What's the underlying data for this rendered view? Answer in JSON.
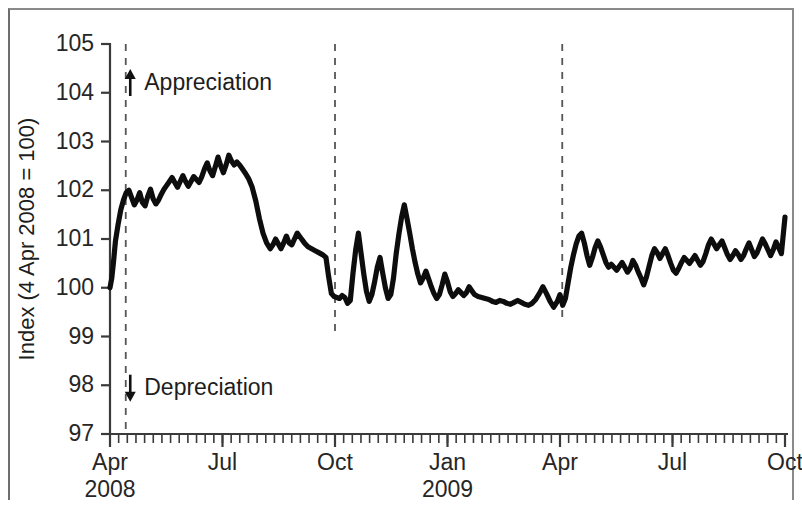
{
  "chart_data": {
    "type": "line",
    "title": "",
    "xlabel": "",
    "ylabel": "Index (4 Apr 2008 = 100)",
    "ylim": [
      97,
      105
    ],
    "xlim": [
      "2008-04-04",
      "2009-10-01"
    ],
    "grid": false,
    "legend_position": "none",
    "y_ticks": [
      97,
      98,
      99,
      100,
      101,
      102,
      103,
      104,
      105
    ],
    "x_ticks": [
      {
        "label": "Apr",
        "year": "2008",
        "pos": 0.0
      },
      {
        "label": "Jul",
        "year": "",
        "pos": 0.25
      },
      {
        "label": "Oct",
        "year": "",
        "pos": 0.5
      },
      {
        "label": "Jan",
        "year": "2009",
        "pos": 0.75
      },
      {
        "label": "Apr",
        "year": "",
        "pos": 1.0
      },
      {
        "label": "Jul",
        "year": "",
        "pos": 1.25
      },
      {
        "label": "Oct",
        "year": "",
        "pos": 1.5
      }
    ],
    "x_minor_tick_count": 78,
    "annotations": [
      {
        "name": "appreciation",
        "text": "Appreciation",
        "arrow": "up",
        "x": 0.045,
        "y": 104.2
      },
      {
        "name": "depreciation",
        "text": "Depreciation",
        "arrow": "down",
        "x": 0.045,
        "y": 97.95
      }
    ],
    "event_lines": [
      {
        "name": "event-line-1",
        "x": 0.035,
        "y_top": 105.0,
        "y_bottom": 97.0,
        "style": "dashed"
      },
      {
        "name": "event-line-2",
        "x": 0.5,
        "y_top": 105.0,
        "y_bottom": 99.05,
        "style": "dashed"
      },
      {
        "name": "event-line-3",
        "x": 1.005,
        "y_top": 105.0,
        "y_bottom": 99.3,
        "style": "dashed"
      }
    ],
    "series": [
      {
        "name": "Exchange rate index",
        "color": "#0d0d0d",
        "points": [
          [
            0.0,
            100.0
          ],
          [
            0.004,
            100.2
          ],
          [
            0.008,
            100.55
          ],
          [
            0.012,
            100.95
          ],
          [
            0.018,
            101.3
          ],
          [
            0.024,
            101.6
          ],
          [
            0.03,
            101.8
          ],
          [
            0.036,
            101.95
          ],
          [
            0.042,
            102.0
          ],
          [
            0.048,
            101.85
          ],
          [
            0.054,
            101.7
          ],
          [
            0.06,
            101.8
          ],
          [
            0.066,
            101.95
          ],
          [
            0.072,
            101.75
          ],
          [
            0.078,
            101.68
          ],
          [
            0.084,
            101.88
          ],
          [
            0.09,
            102.02
          ],
          [
            0.096,
            101.82
          ],
          [
            0.102,
            101.72
          ],
          [
            0.108,
            101.8
          ],
          [
            0.114,
            101.92
          ],
          [
            0.12,
            102.02
          ],
          [
            0.126,
            102.1
          ],
          [
            0.132,
            102.18
          ],
          [
            0.138,
            102.26
          ],
          [
            0.144,
            102.16
          ],
          [
            0.15,
            102.06
          ],
          [
            0.156,
            102.18
          ],
          [
            0.162,
            102.3
          ],
          [
            0.168,
            102.18
          ],
          [
            0.174,
            102.08
          ],
          [
            0.18,
            102.18
          ],
          [
            0.186,
            102.28
          ],
          [
            0.192,
            102.22
          ],
          [
            0.198,
            102.16
          ],
          [
            0.204,
            102.28
          ],
          [
            0.21,
            102.44
          ],
          [
            0.216,
            102.56
          ],
          [
            0.222,
            102.4
          ],
          [
            0.228,
            102.3
          ],
          [
            0.234,
            102.48
          ],
          [
            0.24,
            102.68
          ],
          [
            0.246,
            102.5
          ],
          [
            0.252,
            102.36
          ],
          [
            0.258,
            102.52
          ],
          [
            0.264,
            102.72
          ],
          [
            0.27,
            102.6
          ],
          [
            0.276,
            102.52
          ],
          [
            0.282,
            102.58
          ],
          [
            0.288,
            102.52
          ],
          [
            0.294,
            102.44
          ],
          [
            0.3,
            102.36
          ],
          [
            0.308,
            102.24
          ],
          [
            0.316,
            102.06
          ],
          [
            0.324,
            101.78
          ],
          [
            0.332,
            101.42
          ],
          [
            0.34,
            101.12
          ],
          [
            0.348,
            100.92
          ],
          [
            0.356,
            100.8
          ],
          [
            0.362,
            100.88
          ],
          [
            0.368,
            101.0
          ],
          [
            0.374,
            100.9
          ],
          [
            0.38,
            100.8
          ],
          [
            0.386,
            100.92
          ],
          [
            0.392,
            101.06
          ],
          [
            0.398,
            100.92
          ],
          [
            0.404,
            100.88
          ],
          [
            0.41,
            101.0
          ],
          [
            0.416,
            101.12
          ],
          [
            0.424,
            101.02
          ],
          [
            0.432,
            100.92
          ],
          [
            0.44,
            100.84
          ],
          [
            0.448,
            100.8
          ],
          [
            0.456,
            100.76
          ],
          [
            0.464,
            100.72
          ],
          [
            0.472,
            100.68
          ],
          [
            0.48,
            100.62
          ],
          [
            0.486,
            100.22
          ],
          [
            0.492,
            99.88
          ],
          [
            0.498,
            99.82
          ],
          [
            0.504,
            99.8
          ],
          [
            0.51,
            99.78
          ],
          [
            0.516,
            99.84
          ],
          [
            0.522,
            99.8
          ],
          [
            0.528,
            99.68
          ],
          [
            0.534,
            99.74
          ],
          [
            0.54,
            100.3
          ],
          [
            0.546,
            100.78
          ],
          [
            0.552,
            101.12
          ],
          [
            0.558,
            100.7
          ],
          [
            0.564,
            100.28
          ],
          [
            0.57,
            99.92
          ],
          [
            0.576,
            99.72
          ],
          [
            0.582,
            99.86
          ],
          [
            0.588,
            100.12
          ],
          [
            0.594,
            100.42
          ],
          [
            0.6,
            100.62
          ],
          [
            0.606,
            100.3
          ],
          [
            0.612,
            100.0
          ],
          [
            0.618,
            99.78
          ],
          [
            0.624,
            99.86
          ],
          [
            0.63,
            100.2
          ],
          [
            0.636,
            100.7
          ],
          [
            0.642,
            101.1
          ],
          [
            0.648,
            101.45
          ],
          [
            0.654,
            101.7
          ],
          [
            0.66,
            101.42
          ],
          [
            0.666,
            101.12
          ],
          [
            0.672,
            100.8
          ],
          [
            0.678,
            100.52
          ],
          [
            0.684,
            100.28
          ],
          [
            0.69,
            100.1
          ],
          [
            0.696,
            100.2
          ],
          [
            0.702,
            100.34
          ],
          [
            0.708,
            100.18
          ],
          [
            0.714,
            100.02
          ],
          [
            0.72,
            99.88
          ],
          [
            0.726,
            99.78
          ],
          [
            0.732,
            99.86
          ],
          [
            0.738,
            100.06
          ],
          [
            0.744,
            100.28
          ],
          [
            0.75,
            100.12
          ],
          [
            0.756,
            99.92
          ],
          [
            0.762,
            99.82
          ],
          [
            0.768,
            99.88
          ],
          [
            0.774,
            99.96
          ],
          [
            0.78,
            99.9
          ],
          [
            0.786,
            99.84
          ],
          [
            0.792,
            99.9
          ],
          [
            0.798,
            100.02
          ],
          [
            0.804,
            99.94
          ],
          [
            0.81,
            99.86
          ],
          [
            0.818,
            99.82
          ],
          [
            0.826,
            99.8
          ],
          [
            0.834,
            99.78
          ],
          [
            0.842,
            99.76
          ],
          [
            0.85,
            99.72
          ],
          [
            0.858,
            99.7
          ],
          [
            0.866,
            99.74
          ],
          [
            0.874,
            99.72
          ],
          [
            0.882,
            99.68
          ],
          [
            0.89,
            99.66
          ],
          [
            0.898,
            99.7
          ],
          [
            0.906,
            99.74
          ],
          [
            0.914,
            99.7
          ],
          [
            0.922,
            99.66
          ],
          [
            0.93,
            99.64
          ],
          [
            0.938,
            99.68
          ],
          [
            0.946,
            99.76
          ],
          [
            0.954,
            99.88
          ],
          [
            0.962,
            100.02
          ],
          [
            0.97,
            99.88
          ],
          [
            0.978,
            99.72
          ],
          [
            0.986,
            99.6
          ],
          [
            0.994,
            99.72
          ],
          [
            1.0,
            99.86
          ],
          [
            1.006,
            99.64
          ],
          [
            1.012,
            99.78
          ],
          [
            1.018,
            100.1
          ],
          [
            1.024,
            100.42
          ],
          [
            1.03,
            100.68
          ],
          [
            1.036,
            100.9
          ],
          [
            1.042,
            101.06
          ],
          [
            1.048,
            101.12
          ],
          [
            1.054,
            100.92
          ],
          [
            1.06,
            100.66
          ],
          [
            1.066,
            100.46
          ],
          [
            1.072,
            100.62
          ],
          [
            1.078,
            100.82
          ],
          [
            1.084,
            100.96
          ],
          [
            1.09,
            100.84
          ],
          [
            1.096,
            100.68
          ],
          [
            1.102,
            100.52
          ],
          [
            1.108,
            100.42
          ],
          [
            1.114,
            100.48
          ],
          [
            1.12,
            100.42
          ],
          [
            1.126,
            100.36
          ],
          [
            1.132,
            100.44
          ],
          [
            1.138,
            100.52
          ],
          [
            1.144,
            100.42
          ],
          [
            1.15,
            100.32
          ],
          [
            1.156,
            100.4
          ],
          [
            1.162,
            100.56
          ],
          [
            1.168,
            100.46
          ],
          [
            1.174,
            100.32
          ],
          [
            1.18,
            100.2
          ],
          [
            1.186,
            100.06
          ],
          [
            1.192,
            100.22
          ],
          [
            1.198,
            100.44
          ],
          [
            1.204,
            100.66
          ],
          [
            1.21,
            100.8
          ],
          [
            1.216,
            100.72
          ],
          [
            1.222,
            100.6
          ],
          [
            1.228,
            100.7
          ],
          [
            1.234,
            100.8
          ],
          [
            1.24,
            100.66
          ],
          [
            1.246,
            100.5
          ],
          [
            1.252,
            100.36
          ],
          [
            1.258,
            100.3
          ],
          [
            1.264,
            100.4
          ],
          [
            1.27,
            100.52
          ],
          [
            1.276,
            100.62
          ],
          [
            1.282,
            100.56
          ],
          [
            1.288,
            100.5
          ],
          [
            1.294,
            100.58
          ],
          [
            1.3,
            100.66
          ],
          [
            1.306,
            100.56
          ],
          [
            1.312,
            100.46
          ],
          [
            1.318,
            100.54
          ],
          [
            1.324,
            100.7
          ],
          [
            1.33,
            100.88
          ],
          [
            1.336,
            101.0
          ],
          [
            1.342,
            100.9
          ],
          [
            1.348,
            100.8
          ],
          [
            1.354,
            100.88
          ],
          [
            1.36,
            100.96
          ],
          [
            1.366,
            100.82
          ],
          [
            1.372,
            100.68
          ],
          [
            1.378,
            100.58
          ],
          [
            1.384,
            100.66
          ],
          [
            1.39,
            100.76
          ],
          [
            1.396,
            100.68
          ],
          [
            1.402,
            100.58
          ],
          [
            1.408,
            100.66
          ],
          [
            1.414,
            100.8
          ],
          [
            1.42,
            100.92
          ],
          [
            1.426,
            100.78
          ],
          [
            1.432,
            100.64
          ],
          [
            1.438,
            100.72
          ],
          [
            1.444,
            100.86
          ],
          [
            1.45,
            101.0
          ],
          [
            1.456,
            100.9
          ],
          [
            1.462,
            100.78
          ],
          [
            1.468,
            100.66
          ],
          [
            1.474,
            100.78
          ],
          [
            1.48,
            100.94
          ],
          [
            1.486,
            100.82
          ],
          [
            1.492,
            100.7
          ],
          [
            1.5,
            101.45
          ]
        ]
      }
    ]
  }
}
